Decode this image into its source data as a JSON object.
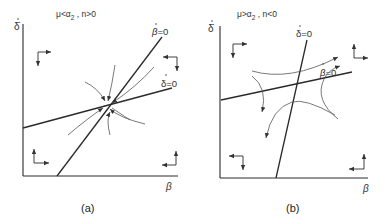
{
  "panels": [
    {
      "id": "a",
      "caption": "(a)",
      "condition": "μ<α₂ , n>0",
      "condition_main": "μ<α",
      "condition_sub": "2",
      "condition_rest": " , n>0",
      "y_axis_label": "δ̇",
      "x_axis_label": "β",
      "isoclines": [
        {
          "label": "β̇ = 0",
          "label_base": "β",
          "label_eq": "=0",
          "type": "steep"
        },
        {
          "label": "δ̇ = 0",
          "label_base": "δ",
          "label_eq": "=0",
          "type": "shallow"
        }
      ],
      "equilibrium_type": "stable node"
    },
    {
      "id": "b",
      "caption": "(b)",
      "condition": "μ>α₂ , n<0",
      "condition_main": "μ>α",
      "condition_sub": "2",
      "condition_rest": " , n<0",
      "y_axis_label": "δ̇",
      "x_axis_label": "β",
      "isoclines": [
        {
          "label": "δ̇ = 0",
          "label_base": "δ",
          "label_eq": "=0",
          "type": "steep"
        },
        {
          "label": "β̇ = 0",
          "label_base": "β",
          "label_eq": "=0",
          "type": "shallow"
        }
      ],
      "equilibrium_type": "saddle point"
    }
  ]
}
